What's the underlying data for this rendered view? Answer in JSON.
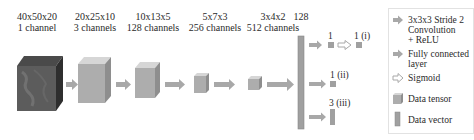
{
  "layers": [
    {
      "dims": "40x50x20",
      "channels": "1 channel"
    },
    {
      "dims": "20x25x10",
      "channels": "3 channels"
    },
    {
      "dims": "10x13x5",
      "channels": "128 channels"
    },
    {
      "dims": "5x7x3",
      "channels": "256 channels"
    },
    {
      "dims": "3x4x2",
      "channels": "512 channels"
    },
    {
      "dims": "128",
      "channels": ""
    }
  ],
  "outputs": {
    "branch1_pre": "1",
    "branch1_post": "1 (i)",
    "branch2": "1 (ii)",
    "branch3": "3 (iii)"
  },
  "legend": {
    "conv": [
      "3x3x3 Stride 2",
      "Convolution",
      "+ ReLU"
    ],
    "fc": [
      "Fully connected",
      "layer"
    ],
    "sigmoid": "Sigmoid",
    "tensor": "Data tensor",
    "vector": "Data vector"
  },
  "colors": {
    "arrow": "#a8a8a8",
    "tensor_face": "#a9a9a9",
    "tensor_top": "#d4d4d4",
    "tensor_side": "#8c8c8c",
    "input_face": "#5a5a5a",
    "vector": "#a0a0a0"
  }
}
